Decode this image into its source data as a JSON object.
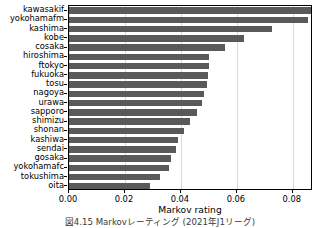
{
  "chart_data": {
    "type": "bar",
    "orientation": "horizontal",
    "title": "",
    "xlabel": "Markov rating",
    "ylabel": "",
    "xlim": [
      0.0,
      0.0872
    ],
    "xticks": [
      0.0,
      0.02,
      0.04,
      0.06,
      0.08
    ],
    "xticklabels": [
      "0.00",
      "0.02",
      "0.04",
      "0.06",
      "0.08"
    ],
    "grid": true,
    "grid_axis": "x",
    "legend": false,
    "bar_color": "#5a5a5a",
    "categories": [
      "kawasakif",
      "yokohamafm",
      "kashima",
      "kobe",
      "cosaka",
      "hiroshima",
      "ftokyo",
      "fukuoka",
      "tosu",
      "nagoya",
      "urawa",
      "sapporo",
      "shimizu",
      "shonan",
      "kashiwa",
      "sendai",
      "gosaka",
      "yokohamafc",
      "tokushima",
      "oita"
    ],
    "values": [
      0.0868,
      0.0853,
      0.0725,
      0.0625,
      0.0556,
      0.0502,
      0.0501,
      0.0498,
      0.0492,
      0.0483,
      0.0475,
      0.0459,
      0.0432,
      0.0412,
      0.0389,
      0.0382,
      0.0364,
      0.0357,
      0.0325,
      0.0291
    ]
  },
  "caption": "図4.15  Markovレーティング (2021年J1リーグ)"
}
